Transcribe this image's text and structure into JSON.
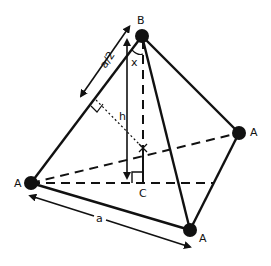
{
  "figure": {
    "colors": {
      "stroke": "#111111",
      "background": "#ffffff"
    },
    "vertices": {
      "apex": {
        "label": "B",
        "x": 142,
        "y": 36
      },
      "left": {
        "label": "A",
        "x": 31,
        "y": 183
      },
      "right": {
        "label": "A",
        "x": 239,
        "y": 133
      },
      "bottom": {
        "label": "A",
        "x": 190,
        "y": 230
      }
    },
    "points": {
      "base_foot": {
        "label": "C",
        "x": 143,
        "y": 183
      },
      "center_marker": {
        "label": "",
        "x": 143,
        "y": 148
      }
    },
    "dimensions": {
      "half_edge": "a/2",
      "height": "h",
      "edge": "a",
      "angle": "x"
    }
  }
}
